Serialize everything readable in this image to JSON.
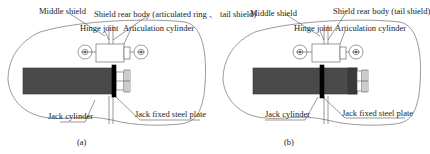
{
  "figure": {
    "panels": [
      {
        "id": "a",
        "caption": "(a)",
        "labels": {
          "middle_shield": "Middle shield",
          "shield_rear_body": "Shield rear body (articulated ring 、 tail shield)",
          "hinge_joint": "Hinge joint",
          "articulation_cylinder": "Articulation cylinder",
          "jack_cylinder": "Jack cylinder",
          "jack_fixed_steel_plate": "Jack fixed steel plate"
        }
      },
      {
        "id": "b",
        "caption": "(b)",
        "labels": {
          "middle_shield": "Middle shield",
          "shield_rear_body": "Shield rear body (tail shield)",
          "hinge_joint": "Hinge joint",
          "articulation_cylinder": "Articulation cylinder",
          "jack_cylinder": "Jack cylinder",
          "jack_fixed_steel_plate": "Jack fixed steel plate"
        }
      }
    ],
    "colors": {
      "line": "#555555",
      "jack_fill": "#4a4a4a",
      "plate_fill": "#000000",
      "background": "#ffffff"
    }
  }
}
